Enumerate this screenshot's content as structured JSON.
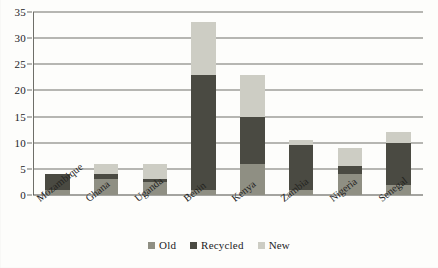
{
  "chart_data": {
    "type": "bar",
    "subtype": "stacked-bar",
    "title": "",
    "subtitle": "",
    "xlabel": "",
    "ylabel": "",
    "ylim": [
      0,
      35
    ],
    "ytick_step": 5,
    "yticks": [
      "0",
      "5",
      "10",
      "15",
      "20",
      "25",
      "30",
      "35"
    ],
    "grid": true,
    "grid_axis": "y",
    "legend_position": "bottom-center",
    "categories": [
      "Mozambique",
      "Ghana",
      "Uganda",
      "Benin",
      "Kenya",
      "Zambia",
      "Nigeria",
      "Senegal"
    ],
    "series": [
      {
        "name": "Old",
        "color": "#8f8f83",
        "values": [
          1,
          3,
          2.5,
          1,
          6,
          1,
          4,
          2
        ]
      },
      {
        "name": "Recycled",
        "color": "#4a4a42",
        "values": [
          3,
          1,
          0.5,
          22,
          9,
          8.5,
          1.5,
          8
        ]
      },
      {
        "name": "New",
        "color": "#cdcdc4",
        "values": [
          0,
          2,
          3,
          10,
          8,
          1,
          3.5,
          2
        ]
      }
    ],
    "totals": [
      4,
      6,
      6,
      33,
      23,
      10.5,
      9,
      12
    ]
  },
  "legend": {
    "items": [
      {
        "label": "Old",
        "color": "#8f8f83"
      },
      {
        "label": "Recycled",
        "color": "#4a4a42"
      },
      {
        "label": "New",
        "color": "#cdcdc4"
      }
    ]
  },
  "colors": {
    "old": "#8f8f83",
    "recycled": "#4a4a42",
    "new": "#cdcdc4",
    "gridline": "#70706a",
    "axis": "#4c4c46",
    "text": "#23231f",
    "background": "#fdfdfb"
  }
}
